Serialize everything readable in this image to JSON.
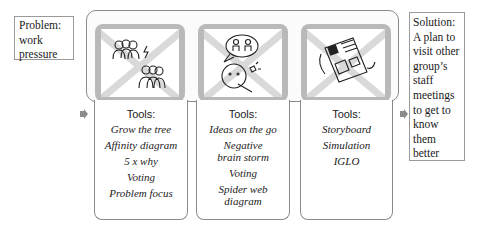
{
  "problem": {
    "label": "Problem:",
    "line1": "work",
    "line2": "pressure"
  },
  "solution": {
    "label": "Solution:",
    "lines": [
      "A plan to",
      "visit other",
      "group’s",
      "staff",
      "meetings",
      "to get to",
      "know",
      "them",
      "better"
    ]
  },
  "stages": [
    {
      "image": "people-conflict-icon",
      "tools_label": "Tools:",
      "tools": [
        "Grow the tree",
        "Affinity diagram",
        "5 x why",
        "Voting",
        "Problem focus"
      ]
    },
    {
      "image": "idea-thinking-icon",
      "tools_label": "Tools:",
      "tools": [
        "Ideas on the go",
        "Negative brain storm",
        "Voting",
        "Spider web diagram"
      ]
    },
    {
      "image": "storyboard-sketch-icon",
      "tools_label": "Tools:",
      "tools": [
        "Storyboard",
        "Simulation",
        "IGLO"
      ]
    }
  ],
  "colors": {
    "frame": "#b9b9b9",
    "border": "#8a8a8a",
    "arrow": "#8c8c8c"
  }
}
